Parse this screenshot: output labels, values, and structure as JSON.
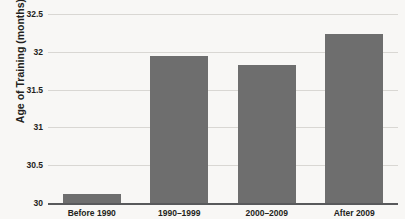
{
  "chart_data": {
    "type": "bar",
    "title": "",
    "xlabel": "",
    "ylabel": "Age of Training (months)",
    "categories": [
      "Before 1990",
      "1990–1999",
      "2000–2009",
      "After 2009"
    ],
    "values": [
      30.12,
      31.95,
      31.83,
      32.24
    ],
    "ylim": [
      30,
      32.5
    ],
    "yticks": [
      30,
      30.5,
      31,
      31.5,
      32,
      32.5
    ],
    "ytick_labels": [
      "30",
      "30.5",
      "31",
      "31.5",
      "32",
      "32.5"
    ],
    "grid": true,
    "legend": false,
    "bar_color": "#6e6e6e",
    "background_color": "#f8f7f5",
    "gridline_color": "#d9d7d3",
    "axis_color": "#58595b"
  }
}
